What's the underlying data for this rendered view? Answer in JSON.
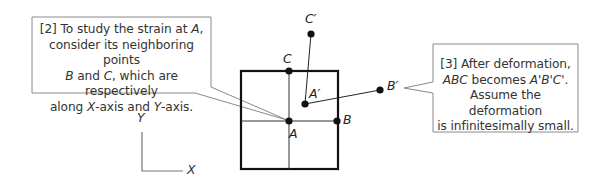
{
  "callouts": {
    "c2": {
      "line1_prefix": "[2] To study the strain at ",
      "line1_var": "A",
      "line1_suffix": ",",
      "line2": "consider its neighboring points",
      "line3_var1": "B",
      "line3_mid": " and ",
      "line3_var2": "C",
      "line3_suffix": ", which are respectively",
      "line4_prefix": "along ",
      "line4_var1": "X",
      "line4_mid": "-axis and ",
      "line4_var2": "Y",
      "line4_suffix": "-axis."
    },
    "c3": {
      "line1": "[3] After deformation,",
      "line2_var1": "ABC",
      "line2_mid": " becomes ",
      "line2_var2": "A'B'C'",
      "line2_suffix": ".",
      "line3": "Assume the deformation",
      "line4": "is infinitesimally small."
    }
  },
  "points": {
    "A": "A",
    "B": "B",
    "C": "C",
    "A_prime": "A′",
    "B_prime": "B′",
    "C_prime": "C′"
  },
  "axes": {
    "x_label": "X",
    "y_label": "Y"
  },
  "colors": {
    "line": "#111111",
    "callout_border": "#8a8a8a",
    "axis": "#777777"
  }
}
